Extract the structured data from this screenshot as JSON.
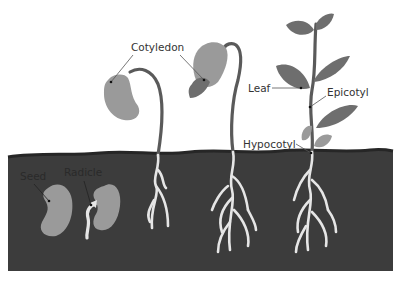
{
  "colors": {
    "background": "#ffffff",
    "soil": "#3c3c3c",
    "soil_surface": "#2a2a2a",
    "seed": "#9a9a9a",
    "cotyledon": "#9a9a9a",
    "leaf": "#6e6e6e",
    "stem": "#5a5a5a",
    "root": "#e6e6e6",
    "label_text": "#333333"
  },
  "labels": {
    "seed": "Seed",
    "radicle": "Radicle",
    "cotyledon": "Cotyledon",
    "leaf": "Leaf",
    "epicotyl": "Epicotyl",
    "hypocotyl": "Hypocotyl"
  },
  "stages": [
    {
      "index": 1,
      "name": "seed"
    },
    {
      "index": 2,
      "name": "radicle emerging"
    },
    {
      "index": 3,
      "name": "hooked seedling"
    },
    {
      "index": 4,
      "name": "seedling with cotyledons"
    },
    {
      "index": 5,
      "name": "young plant with leaves"
    }
  ]
}
